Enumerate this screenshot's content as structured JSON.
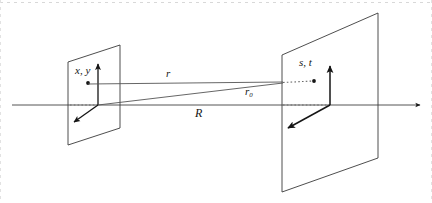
{
  "figure": {
    "colors": {
      "stroke": "#3a3a3a",
      "stroke_dark": "#151515",
      "axis": "#5a5a5a",
      "dotted": "#6a6a6a",
      "background": "#ffffff",
      "border": "#cfcfcf"
    },
    "labels": {
      "source_plane_coords": "x, y",
      "observation_plane_coords": "s, t",
      "ray_distance": "r",
      "axial_distance_sub_base": "r",
      "axial_distance_sub": "0",
      "separation": "R"
    },
    "elements": {
      "source_plane_name": "source-plane",
      "observation_plane_name": "observation-plane",
      "optical_axis_name": "optical-axis",
      "source_point_name": "source-point",
      "observation_point_name": "observation-point"
    }
  }
}
